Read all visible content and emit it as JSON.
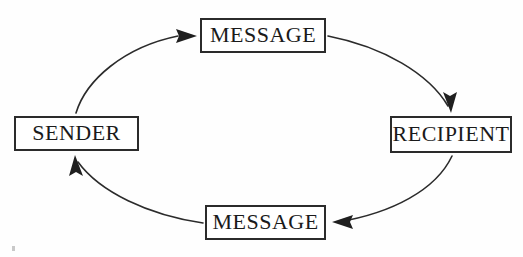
{
  "diagram": {
    "type": "cycle-flow",
    "background_color": "#fefefe",
    "stroke_color": "#2b2b2b",
    "text_color": "#1a1a1a",
    "nodes": [
      {
        "id": "message-top",
        "label": "MESSAGE",
        "x": 200,
        "y": 18,
        "width": 126,
        "height": 35
      },
      {
        "id": "recipient",
        "label": "RECIPIENT",
        "x": 390,
        "y": 116,
        "width": 122,
        "height": 37
      },
      {
        "id": "message-bottom",
        "label": "MESSAGE",
        "x": 205,
        "y": 205,
        "width": 121,
        "height": 35
      },
      {
        "id": "sender",
        "label": "SENDER",
        "x": 14,
        "y": 116,
        "width": 125,
        "height": 35
      }
    ],
    "edges": [
      {
        "id": "sender-to-message-top",
        "from": "sender",
        "to": "message-top",
        "direction": "clockwise"
      },
      {
        "id": "message-top-to-recipient",
        "from": "message-top",
        "to": "recipient",
        "direction": "clockwise"
      },
      {
        "id": "recipient-to-message-bottom",
        "from": "recipient",
        "to": "message-bottom",
        "direction": "clockwise"
      },
      {
        "id": "message-bottom-to-sender",
        "from": "message-bottom",
        "to": "sender",
        "direction": "clockwise"
      }
    ]
  }
}
